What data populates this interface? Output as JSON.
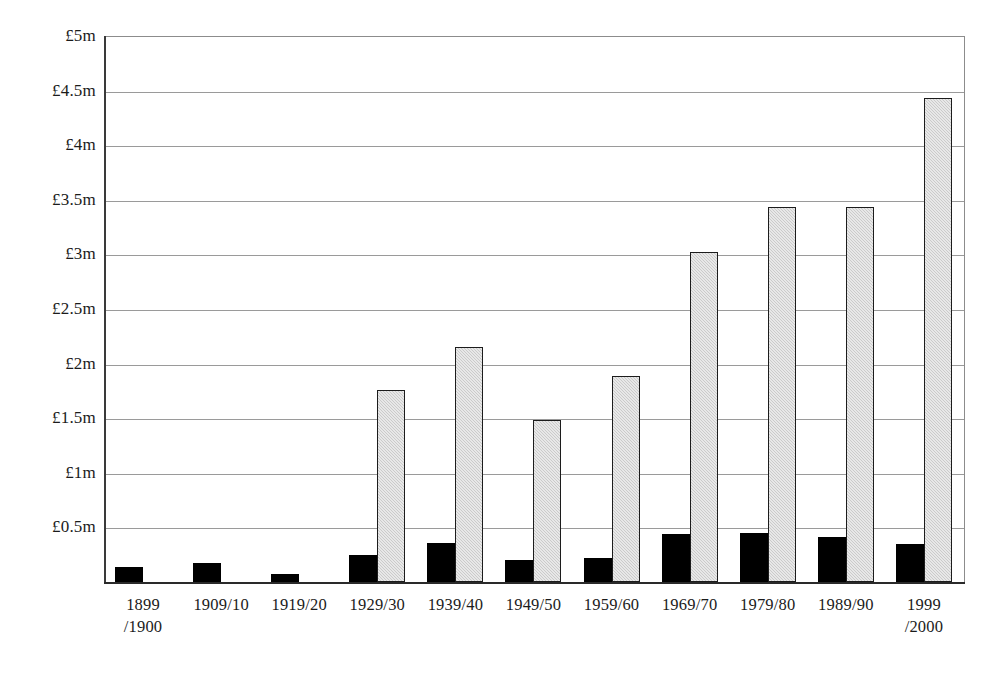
{
  "chart_data": {
    "type": "bar",
    "title": "",
    "subtitle": "",
    "xlabel": "",
    "ylabel": "",
    "grid": true,
    "legend_position": "none",
    "ylim": [
      0,
      5
    ],
    "y_unit": "£ million",
    "y_ticks": [
      0.5,
      1,
      1.5,
      2,
      2.5,
      3,
      3.5,
      4,
      4.5,
      5
    ],
    "y_tick_labels": [
      "£0.5m",
      "£1m",
      "£1.5m",
      "£2m",
      "£2.5m",
      "£3m",
      "£3.5m",
      "£4m",
      "£4.5m",
      "£5m"
    ],
    "categories": [
      "1899\n/1900",
      "1909/10",
      "1919/20",
      "1929/30",
      "1939/40",
      "1949/50",
      "1959/60",
      "1969/70",
      "1979/80",
      "1989/90",
      "1999\n/2000"
    ],
    "series": [
      {
        "name": "Series 1",
        "color": "#000000",
        "values": [
          0.14,
          0.17,
          0.07,
          0.25,
          0.36,
          0.2,
          0.22,
          0.44,
          0.45,
          0.41,
          0.35
        ]
      },
      {
        "name": "Series 2",
        "color": "#cbcbcb",
        "values": [
          0,
          0,
          0,
          1.76,
          2.15,
          1.48,
          1.89,
          3.02,
          3.43,
          3.43,
          4.43
        ]
      }
    ],
    "annotations": []
  },
  "colors": {
    "series_1": "#000000",
    "series_2": "#cbcbcb",
    "series_2_outline": "#1c1c1c",
    "gridline": "#9a9a9a",
    "axis": "#2a2a2a",
    "background": "#ffffff",
    "text": "#1b1b1b"
  }
}
